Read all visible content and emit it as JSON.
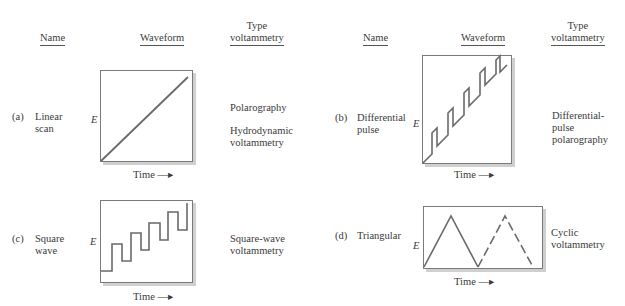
{
  "headers": {
    "left": {
      "name": "Name",
      "waveform": "Waveform",
      "type_line1": "Type",
      "type_line2": "voltammetry"
    },
    "right": {
      "name": "Name",
      "waveform": "Waveform",
      "type_line1": "Type",
      "type_line2": "voltammetry"
    }
  },
  "axis": {
    "y_label": "E",
    "x_label": "Time —▸"
  },
  "rows": [
    {
      "id": "a",
      "label": "(a)",
      "name_line1": "Linear",
      "name_line2": "scan",
      "waveform": "linear-ramp",
      "types": [
        "Polarography",
        "Hydrodynamic\nvoltammetry"
      ]
    },
    {
      "id": "b",
      "label": "(b)",
      "name_line1": "Differential",
      "name_line2": "pulse",
      "waveform": "staircase-pulse",
      "types": [
        "Differential-\npulse\npolarography"
      ]
    },
    {
      "id": "c",
      "label": "(c)",
      "name_line1": "Square",
      "name_line2": "wave",
      "waveform": "square-wave-staircase",
      "types": [
        "Square-wave\nvoltammetry"
      ]
    },
    {
      "id": "d",
      "label": "(d)",
      "name_line1": "Triangular",
      "name_line2": "",
      "waveform": "triangular",
      "types": [
        "Cyclic\nvoltammetry"
      ]
    }
  ],
  "colors": {
    "line": "#6a6a6a",
    "frame": "#7a7a7a",
    "shadow": "#c8c8c8",
    "text": "#3a3a3a"
  }
}
